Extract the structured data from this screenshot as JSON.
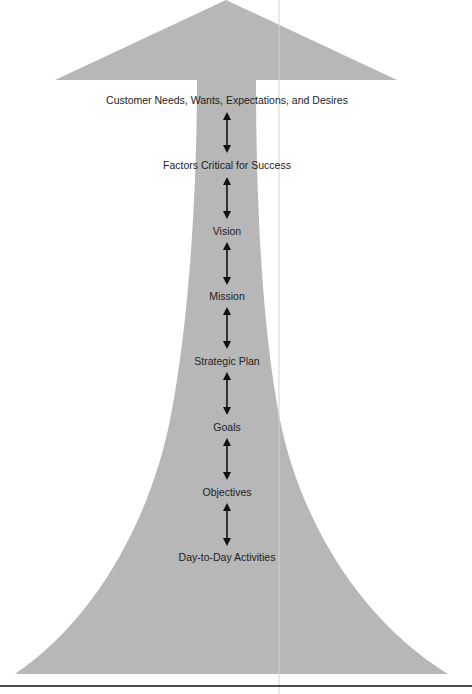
{
  "diagram": {
    "title": "",
    "shape_color": "#b7b7b7",
    "text_color": "#222222",
    "arrow_color": "#111111",
    "levels": [
      {
        "label": "Customer Needs, Wants, Expectations, and Desires",
        "y": 100
      },
      {
        "label": "Factors Critical for Success",
        "y": 165
      },
      {
        "label": "Vision",
        "y": 231
      },
      {
        "label": "Mission",
        "y": 296
      },
      {
        "label": "Strategic Plan",
        "y": 361
      },
      {
        "label": "Goals",
        "y": 427
      },
      {
        "label": "Objectives",
        "y": 492
      },
      {
        "label": "Day-to-Day Activities",
        "y": 557
      }
    ],
    "connectors": [
      {
        "from": "Customer Needs, Wants, Expectations, and Desires",
        "to": "Factors Critical for Success",
        "type": "bidirectional"
      },
      {
        "from": "Factors Critical for Success",
        "to": "Vision",
        "type": "bidirectional"
      },
      {
        "from": "Vision",
        "to": "Mission",
        "type": "bidirectional"
      },
      {
        "from": "Mission",
        "to": "Strategic Plan",
        "type": "bidirectional"
      },
      {
        "from": "Strategic Plan",
        "to": "Goals",
        "type": "bidirectional"
      },
      {
        "from": "Goals",
        "to": "Objectives",
        "type": "bidirectional"
      },
      {
        "from": "Objectives",
        "to": "Day-to-Day Activities",
        "type": "bidirectional"
      }
    ]
  }
}
